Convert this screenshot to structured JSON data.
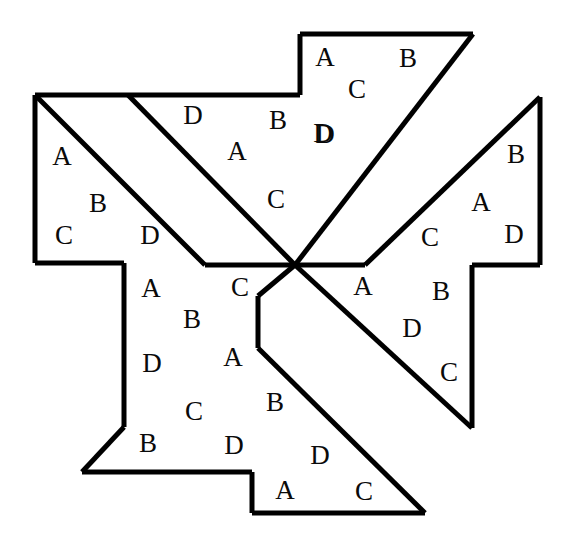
{
  "figure": {
    "background_color": "#ffffff",
    "stroke_color": "#000000",
    "label_color": "#0a0a0a",
    "stroke_width": 5,
    "center_point": {
      "x": 295,
      "y": 265
    },
    "canvas": {
      "width": 568,
      "height": 542
    },
    "label_alphabet": [
      "A",
      "B",
      "C",
      "D"
    ],
    "pieces": [
      {
        "name": "piece-top",
        "id": "top",
        "points": "300,34 473,34 295,212 295,265 365,265 540,97",
        "path": "M 300 34 L 473 34 L 295 212 L 295 265",
        "labels": [
          {
            "text": "A",
            "x": 325,
            "y": 66
          },
          {
            "text": "B",
            "x": 408,
            "y": 67
          },
          {
            "text": "C",
            "x": 357,
            "y": 98
          },
          {
            "text": "D",
            "x": 325,
            "y": 143
          }
        ]
      },
      {
        "name": "piece-left",
        "id": "left",
        "points": "35,95 128,95 295,265 205,265 124,265 35,263",
        "path": "M 128 95 L 35 95 L 35 263 L 124 263 L 124 265",
        "labels": [
          {
            "text": "A",
            "x": 62,
            "y": 165
          },
          {
            "text": "B",
            "x": 98,
            "y": 212
          },
          {
            "text": "C",
            "x": 64,
            "y": 244
          },
          {
            "text": "D",
            "x": 150,
            "y": 244
          }
        ]
      },
      {
        "name": "piece-top-left-arm",
        "id": "top-left-arm",
        "points": "128,95 300,95 295,265 205,265",
        "path": "M 128 95 L 295 265 L 205 265",
        "labels": [
          {
            "text": "D",
            "x": 193,
            "y": 124
          },
          {
            "text": "B",
            "x": 278,
            "y": 129
          },
          {
            "text": "A",
            "x": 237,
            "y": 160
          },
          {
            "text": "D",
            "x": 323,
            "y": 142
          },
          {
            "text": "C",
            "x": 276,
            "y": 208
          }
        ]
      },
      {
        "name": "piece-right",
        "id": "right",
        "points": "540,97 540,265 472,265 472,428 295,265 365,265",
        "path": "M 540 97 L 540 265 L 472 265 L 472 428 L 295 265 L 365 265 Z",
        "labels": [
          {
            "text": "B",
            "x": 516,
            "y": 163
          },
          {
            "text": "A",
            "x": 481,
            "y": 211
          },
          {
            "text": "D",
            "x": 514,
            "y": 243
          },
          {
            "text": "C",
            "x": 430,
            "y": 246
          },
          {
            "text": "A",
            "x": 363,
            "y": 295
          },
          {
            "text": "B",
            "x": 441,
            "y": 300
          },
          {
            "text": "D",
            "x": 412,
            "y": 337
          },
          {
            "text": "C",
            "x": 449,
            "y": 381
          }
        ]
      },
      {
        "name": "piece-bottom",
        "id": "bottom",
        "points": "258,296 258,348 425,513 252,513 252,472 82,472 124,427 124,265 205,265 295,265",
        "path": "M 295 265 L 258 296 L 258 348 L 425 513 L 252 513 L 252 472 L 82 472 L 124 427 L 124 265",
        "labels": [
          {
            "text": "C",
            "x": 240,
            "y": 296
          },
          {
            "text": "A",
            "x": 151,
            "y": 297
          },
          {
            "text": "B",
            "x": 192,
            "y": 328
          },
          {
            "text": "A",
            "x": 233,
            "y": 366
          },
          {
            "text": "D",
            "x": 152,
            "y": 372
          },
          {
            "text": "C",
            "x": 194,
            "y": 420
          },
          {
            "text": "B",
            "x": 275,
            "y": 411
          },
          {
            "text": "B",
            "x": 148,
            "y": 452
          },
          {
            "text": "D",
            "x": 234,
            "y": 454
          },
          {
            "text": "D",
            "x": 320,
            "y": 464
          },
          {
            "text": "A",
            "x": 285,
            "y": 499
          },
          {
            "text": "C",
            "x": 364,
            "y": 500
          }
        ]
      }
    ],
    "outline_segments": [
      {
        "name": "top-edge",
        "d": "M 300 34 L 473 34"
      },
      {
        "name": "top-left-vertical",
        "d": "M 300 34 L 300 95"
      },
      {
        "name": "top-notch-horizontal",
        "d": "M 300 95 L 128 95"
      },
      {
        "name": "left-top-horizontal",
        "d": "M 128 95 L 35 95"
      },
      {
        "name": "left-vertical",
        "d": "M 35 95 L 35 263"
      },
      {
        "name": "left-bottom-horizontal",
        "d": "M 35 263 L 124 263"
      },
      {
        "name": "inner-left-vertical",
        "d": "M 124 263 L 124 427"
      },
      {
        "name": "bottom-left-diagonal",
        "d": "M 124 427 L 82 472"
      },
      {
        "name": "bottom-horizontal",
        "d": "M 82 472 L 252 472"
      },
      {
        "name": "bottom-step-vertical",
        "d": "M 252 472 L 252 513"
      },
      {
        "name": "bottom-edge",
        "d": "M 252 513 L 425 513"
      },
      {
        "name": "bottom-right-diagonal",
        "d": "M 425 513 L 258 348"
      },
      {
        "name": "inner-center-vertical",
        "d": "M 258 348 L 258 296"
      },
      {
        "name": "inner-center-diagonal",
        "d": "M 258 296 L 295 265"
      },
      {
        "name": "center-to-right-horizontal",
        "d": "M 295 265 L 365 265"
      },
      {
        "name": "right-up-diagonal",
        "d": "M 365 265 L 540 97"
      },
      {
        "name": "right-vertical-upper",
        "d": "M 540 97 L 540 265"
      },
      {
        "name": "right-notch-horizontal",
        "d": "M 540 265 L 472 265"
      },
      {
        "name": "right-vertical-lower",
        "d": "M 472 265 L 472 428"
      },
      {
        "name": "right-down-diagonal",
        "d": "M 472 428 L 295 265"
      },
      {
        "name": "center-top-diagonal",
        "d": "M 295 265 L 473 34"
      },
      {
        "name": "upper-left-diagonal",
        "d": "M 128 95 L 295 265"
      },
      {
        "name": "left-inner-diagonal",
        "d": "M 35 95 L 205 265"
      },
      {
        "name": "center-left-horizontal",
        "d": "M 205 265 L 295 265"
      }
    ]
  }
}
